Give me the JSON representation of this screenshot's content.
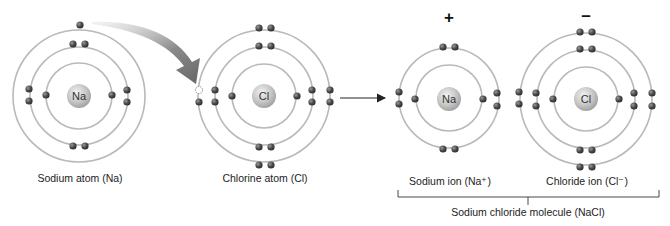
{
  "diagram": {
    "atoms": [
      {
        "id": "sodium-atom",
        "symbol": "Na",
        "caption": "Sodium atom (Na)",
        "charge": "",
        "shells": [
          2,
          8,
          1
        ]
      },
      {
        "id": "chlorine-atom",
        "symbol": "Cl",
        "caption": "Chlorine atom (Cl)",
        "charge": "",
        "shells": [
          2,
          8,
          7
        ]
      },
      {
        "id": "sodium-ion",
        "symbol": "Na",
        "caption": "Sodium ion (Na⁺)",
        "charge": "+",
        "shells": [
          2,
          8
        ]
      },
      {
        "id": "chloride-ion",
        "symbol": "Cl",
        "caption": "Chloride ion (Cl⁻)",
        "charge": "–",
        "shells": [
          2,
          8,
          8
        ]
      }
    ],
    "bracket_label": "Sodium chloride molecule (NaCl)",
    "arrows": [
      {
        "name": "electron-transfer-arrow",
        "from": "sodium-atom",
        "to": "chlorine-atom"
      },
      {
        "name": "reaction-arrow",
        "from": "chlorine-atom",
        "to": "sodium-ion"
      }
    ],
    "colors": {
      "orbit": "#b9b9b9",
      "electron": "#555555",
      "nucleus": "#c8c8c8",
      "arrow": "#6b6b6b",
      "text": "#222222"
    }
  }
}
